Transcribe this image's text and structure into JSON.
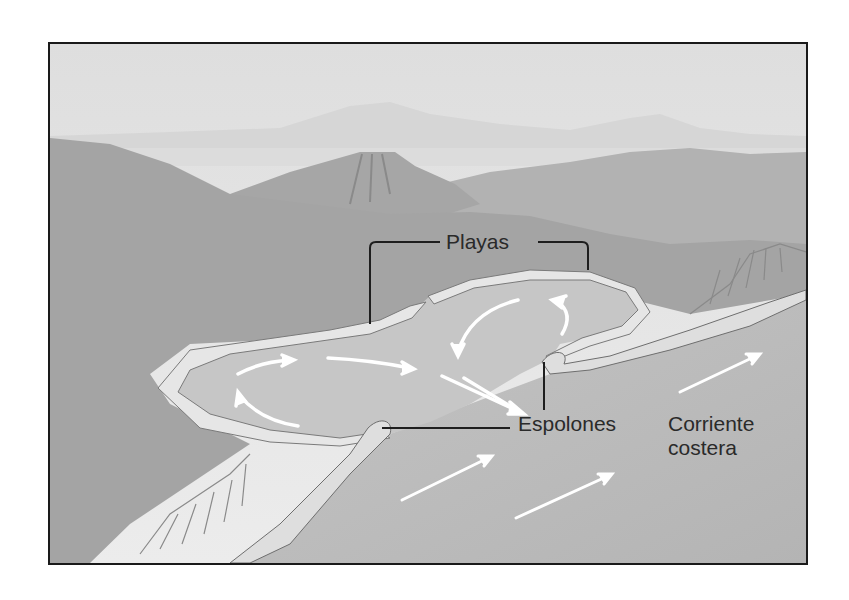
{
  "figure": {
    "labels": {
      "playas": "Playas",
      "espolones": "Espolones",
      "corriente_line1": "Corriente",
      "corriente_line2": "costera"
    },
    "elements": [
      {
        "name": "sky",
        "description": "hazy pale sky"
      },
      {
        "name": "distant-mountains",
        "description": "faint far ridges on the horizon"
      },
      {
        "name": "volcano",
        "description": "flat-topped cone in the middle distance"
      },
      {
        "name": "hills",
        "description": "sloping coastal hills framing the bay"
      },
      {
        "name": "bay",
        "description": "lobed bay with pale sand beaches"
      },
      {
        "name": "groins",
        "description": "two curved spits / jetties (espolones) at bay mouths"
      },
      {
        "name": "cliffs",
        "description": "striated cliffs on left and right shorelines"
      },
      {
        "name": "ocean",
        "description": "open water with longshore current"
      }
    ],
    "arrows": {
      "bay_circulation": 6,
      "longshore_current": 3,
      "color": "#ffffff"
    },
    "colors": {
      "border": "#1a1a1a",
      "sky": "#e4e4e4",
      "hills": "#a8a8a8",
      "water": "#bdbdbd",
      "beach": "#e2e2e2",
      "text": "#2a2a2a"
    }
  }
}
